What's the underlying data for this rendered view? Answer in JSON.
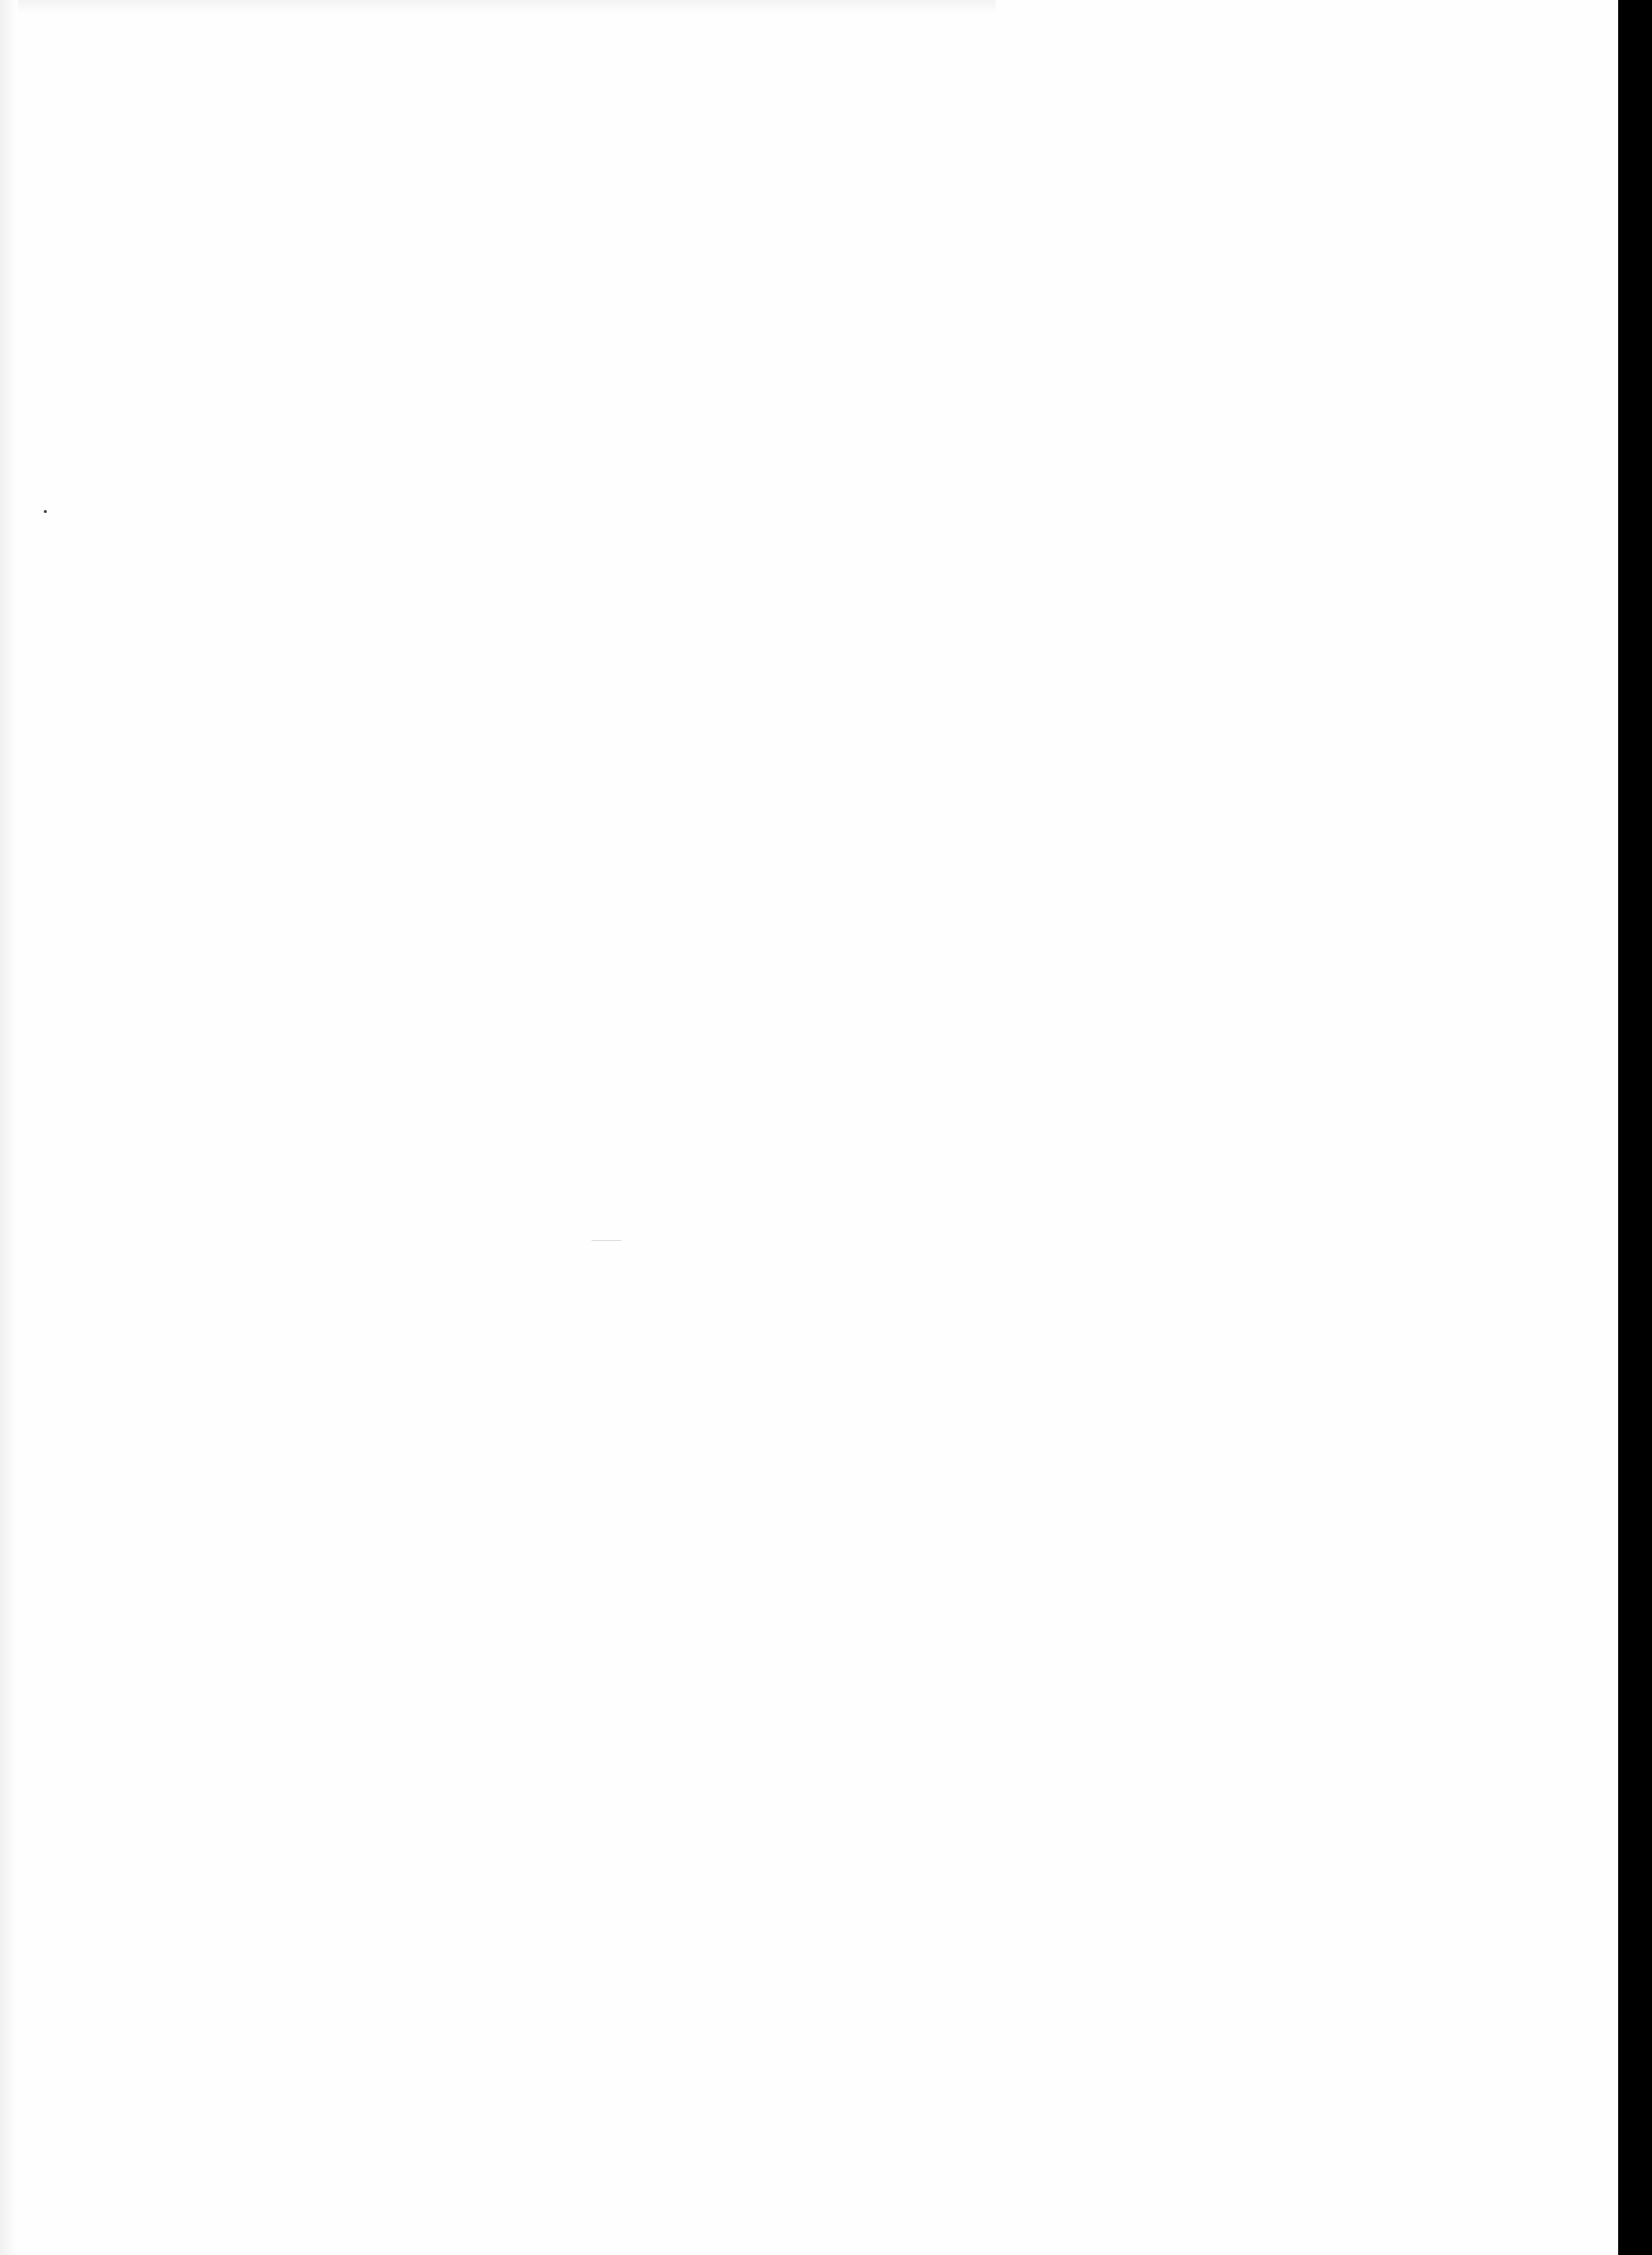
{
  "page": {
    "type": "blank scanned page",
    "text": "",
    "background_color": "#ffffff",
    "edge_color": "#000000"
  }
}
